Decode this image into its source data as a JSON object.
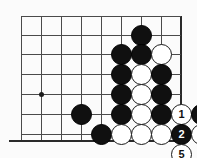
{
  "figure": {
    "name": "go-board-diagram",
    "width": 197,
    "height": 158,
    "background_color": "#fbfbfb"
  },
  "board": {
    "line_color": "#4a4a4a",
    "edge_color": "#2a2a2a",
    "grid_spacing": 20,
    "vertical_lines_x": [
      21,
      41,
      61,
      81,
      101,
      121,
      141,
      161,
      181
    ],
    "horizontal_lines_y": [
      16,
      35,
      54,
      74,
      94,
      114,
      134
    ],
    "right_edge_x": 181,
    "bottom_edge_y": 140,
    "star_points": [
      {
        "name": "star-point-left",
        "x": 41,
        "y": 94
      }
    ]
  },
  "stones": [
    {
      "name": "stone-black-a",
      "color": "black",
      "x": 141,
      "y": 35,
      "label": ""
    },
    {
      "name": "stone-black-b",
      "color": "black",
      "x": 121,
      "y": 54,
      "label": ""
    },
    {
      "name": "stone-black-c",
      "color": "black",
      "x": 141,
      "y": 54,
      "label": ""
    },
    {
      "name": "stone-white-a",
      "color": "white",
      "x": 161,
      "y": 54,
      "label": ""
    },
    {
      "name": "stone-black-d",
      "color": "black",
      "x": 121,
      "y": 74,
      "label": ""
    },
    {
      "name": "stone-white-b",
      "color": "white",
      "x": 141,
      "y": 74,
      "label": ""
    },
    {
      "name": "stone-black-e",
      "color": "black",
      "x": 161,
      "y": 74,
      "label": ""
    },
    {
      "name": "stone-black-f",
      "color": "black",
      "x": 121,
      "y": 94,
      "label": ""
    },
    {
      "name": "stone-white-c",
      "color": "white",
      "x": 141,
      "y": 94,
      "label": ""
    },
    {
      "name": "stone-black-g",
      "color": "black",
      "x": 161,
      "y": 94,
      "label": ""
    },
    {
      "name": "stone-black-h",
      "color": "black",
      "x": 81,
      "y": 114,
      "label": ""
    },
    {
      "name": "stone-black-i",
      "color": "black",
      "x": 121,
      "y": 114,
      "label": ""
    },
    {
      "name": "stone-white-d",
      "color": "white",
      "x": 141,
      "y": 114,
      "label": ""
    },
    {
      "name": "stone-black-j",
      "color": "black",
      "x": 161,
      "y": 114,
      "label": ""
    },
    {
      "name": "stone-black-k",
      "color": "black",
      "x": 101,
      "y": 134,
      "label": ""
    },
    {
      "name": "stone-white-e",
      "color": "white",
      "x": 121,
      "y": 134,
      "label": ""
    },
    {
      "name": "stone-white-f",
      "color": "white",
      "x": 141,
      "y": 134,
      "label": ""
    },
    {
      "name": "stone-white-g",
      "color": "white",
      "x": 161,
      "y": 134,
      "label": ""
    }
  ],
  "numbered_moves": [
    {
      "name": "move-1",
      "color": "white",
      "x": 181,
      "y": 114,
      "label": "1"
    },
    {
      "name": "move-2",
      "color": "black",
      "x": 181,
      "y": 134,
      "label": "2"
    },
    {
      "name": "move-3",
      "color": "white",
      "x": 201,
      "y": 134,
      "label": "3"
    },
    {
      "name": "move-4",
      "color": "black",
      "x": 201,
      "y": 114,
      "label": "4"
    },
    {
      "name": "move-5",
      "color": "white",
      "x": 181,
      "y": 154,
      "label": "5"
    }
  ],
  "colors": {
    "black_stone": "#101010",
    "white_stone": "#ffffff",
    "stone_outline": "#1a1a1a",
    "black_label_text": "#ffffff",
    "white_label_text": "#111111"
  }
}
